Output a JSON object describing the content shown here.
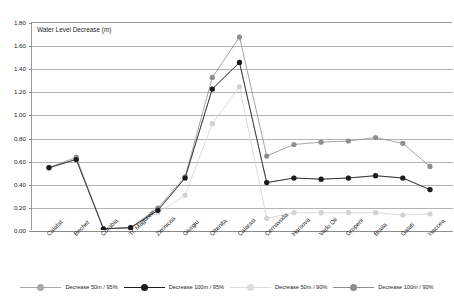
{
  "chart_data": {
    "type": "line",
    "title": "Water Level Decrease (m)",
    "xlabel": "",
    "ylabel": "",
    "ylim": [
      0.0,
      1.8
    ],
    "ytick_step": 0.2,
    "grid": true,
    "legend_position": "bottom",
    "ytick_labels": [
      "1.80",
      "1.60",
      "1.40",
      "1.20",
      "1.00",
      "0.80",
      "0.60",
      "0.40",
      "0.20",
      "0.00"
    ],
    "ytick_values": [
      1.8,
      1.6,
      1.4,
      1.2,
      1.0,
      0.8,
      0.6,
      0.4,
      0.2,
      0.0
    ],
    "categories": [
      "Calafat",
      "Bechet",
      "Corabia",
      "Tr. Magurele",
      "Zimnicea",
      "Giurgiu",
      "Oltenita",
      "Calarasi",
      "Cernavoda",
      "Harsova",
      "Vadu Oii",
      "Gropeni",
      "Braila",
      "Galati",
      "Isaccea"
    ],
    "series": [
      {
        "name": "Decrease 50m / 95%",
        "color": "#a0a0a0",
        "values": [
          0.54,
          0.61,
          0.01,
          0.02,
          0.17,
          0.45,
          1.22,
          1.45,
          0.41,
          0.45,
          0.44,
          0.45,
          0.47,
          0.45,
          0.35
        ]
      },
      {
        "name": "Decrease 100m / 95%",
        "color": "#1c1c1c",
        "values": [
          0.54,
          0.61,
          0.01,
          0.02,
          0.17,
          0.45,
          1.22,
          1.45,
          0.41,
          0.45,
          0.44,
          0.45,
          0.47,
          0.45,
          0.35
        ]
      },
      {
        "name": "Decrease 50m / 90%",
        "color": "#d2d2d2",
        "values": [
          0.53,
          0.62,
          0.01,
          0.02,
          0.15,
          0.3,
          0.92,
          1.24,
          0.1,
          0.15,
          0.15,
          0.15,
          0.15,
          0.13,
          0.14
        ]
      },
      {
        "name": "Decrease 100m / 90%",
        "color": "#8e8e8e",
        "values": [
          0.54,
          0.63,
          0.01,
          0.02,
          0.19,
          0.46,
          1.32,
          1.67,
          0.64,
          0.74,
          0.76,
          0.77,
          0.8,
          0.75,
          0.55
        ]
      }
    ]
  },
  "legend": {
    "entries": [
      {
        "label": "Decrease 50m / 95%",
        "color": "#a8a8a8"
      },
      {
        "label": "Decrease 100m / 95%",
        "color": "#1c1c1c"
      },
      {
        "label": "Decrease 50m / 90%",
        "color": "#dcdcdc"
      },
      {
        "label": "Decrease 100m / 90%",
        "color": "#8e8e8e"
      }
    ]
  }
}
